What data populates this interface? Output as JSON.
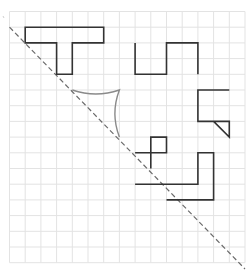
{
  "diagram": {
    "type": "grid-reflection-puzzle",
    "grid": {
      "origin_x": 9.5,
      "origin_y": 11.5,
      "cell": 15.7,
      "cols": 15,
      "rows": 16,
      "line_color": "#e3e3e3"
    },
    "mirror_line": {
      "style": "dashed",
      "color": "#6a6a6a",
      "from": [
        0,
        1
      ],
      "to": [
        15,
        16.4
      ]
    },
    "shapes": [
      {
        "id": "t-shape",
        "closed": true,
        "color": "#333333",
        "points": [
          [
            1,
            1
          ],
          [
            6,
            1
          ],
          [
            6,
            2
          ],
          [
            4,
            2
          ],
          [
            4,
            4
          ],
          [
            3,
            4
          ],
          [
            3,
            2
          ],
          [
            1,
            2
          ]
        ]
      },
      {
        "id": "zigzag",
        "closed": false,
        "color": "#333333",
        "points": [
          [
            8,
            2
          ],
          [
            8,
            4
          ],
          [
            10,
            4
          ],
          [
            10,
            2
          ],
          [
            12,
            2
          ],
          [
            12,
            4
          ]
        ]
      },
      {
        "id": "hook",
        "closed": false,
        "color": "#333333",
        "points": [
          [
            14,
            5
          ],
          [
            12,
            5
          ],
          [
            12,
            7
          ],
          [
            14,
            7
          ],
          [
            14,
            8
          ],
          [
            13,
            7
          ]
        ]
      },
      {
        "id": "small-square",
        "closed": true,
        "color": "#333333",
        "points": [
          [
            9,
            8
          ],
          [
            10,
            8
          ],
          [
            10,
            9
          ],
          [
            9,
            9
          ]
        ]
      },
      {
        "id": "square-tail",
        "closed": false,
        "color": "#333333",
        "points": [
          [
            8,
            9
          ],
          [
            9,
            9
          ],
          [
            9,
            10
          ]
        ]
      },
      {
        "id": "l-shape",
        "closed": false,
        "color": "#333333",
        "points": [
          [
            8,
            11
          ],
          [
            12,
            11
          ],
          [
            12,
            9
          ],
          [
            13,
            9
          ],
          [
            13,
            12
          ],
          [
            10,
            12
          ]
        ]
      }
    ],
    "curved_shape": {
      "id": "concave-triangle",
      "color": "#8a8a8a",
      "from": [
        4,
        5
      ],
      "mid": [
        7,
        5
      ],
      "to": [
        7,
        8
      ]
    }
  }
}
